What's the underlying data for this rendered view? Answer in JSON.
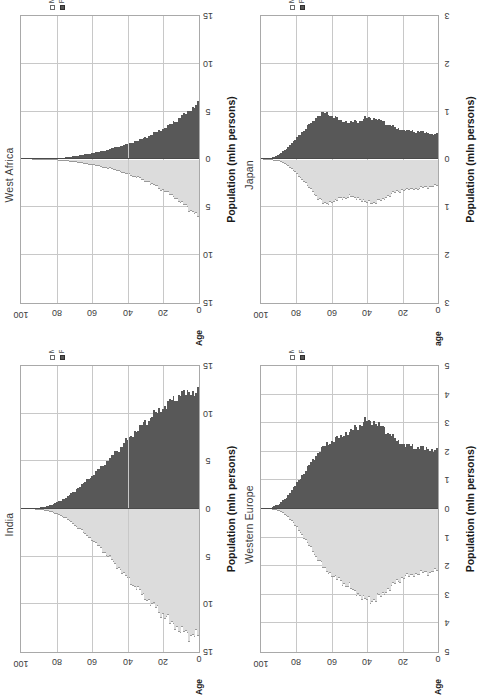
{
  "figure": {
    "kind": "population-pyramid-grid",
    "rotation_deg": -90,
    "panel_order": [
      "west_africa",
      "japan",
      "india",
      "western_europe"
    ]
  },
  "legend": {
    "male_label": "Male",
    "female_label": "Female",
    "male_swatch": "#ffffff",
    "female_swatch": "#585858"
  },
  "axes": {
    "population_title": "Population (mln persons)",
    "age_title_upper": "Age",
    "age_title_lower": "age",
    "age_ticks": [
      "100",
      "80",
      "60",
      "40",
      "20",
      "0"
    ]
  },
  "chart_data": [
    {
      "id": "west_africa",
      "type": "bar",
      "title": "West Africa",
      "subplot_position": "top-left",
      "xlabel": "Population (mln persons)",
      "ylabel": "Age",
      "ylabel_text": "Age",
      "legend": [
        "Male",
        "Female"
      ],
      "grid": true,
      "orientation": "horizontal-pyramid",
      "xlim": [
        -15,
        15
      ],
      "xticks": [
        -15,
        -10,
        -5,
        0,
        5,
        10,
        15
      ],
      "xtick_labels": [
        "15",
        "10",
        "5",
        "0",
        "5",
        "10",
        "15"
      ],
      "ylim": [
        0,
        100
      ],
      "yticks": [
        100,
        80,
        60,
        40,
        20,
        0
      ],
      "ytick_labels": [
        "100",
        "80",
        "60",
        "40",
        "20",
        "0"
      ],
      "ages": [
        0,
        5,
        10,
        15,
        20,
        25,
        30,
        35,
        40,
        45,
        50,
        55,
        60,
        65,
        70,
        75,
        80,
        85,
        90,
        95,
        100
      ],
      "series": [
        {
          "name": "Female",
          "side": "right",
          "color": "#585858",
          "values_by_age": [
            5.85,
            5.1,
            4.4,
            3.75,
            3.2,
            2.72,
            2.3,
            1.95,
            1.62,
            1.34,
            1.08,
            0.86,
            0.66,
            0.49,
            0.34,
            0.22,
            0.13,
            0.07,
            0.03,
            0.01,
            0.0
          ]
        },
        {
          "name": "Male",
          "side": "left",
          "color": "#dcdcdc",
          "values_by_age": [
            5.95,
            5.18,
            4.46,
            3.78,
            3.2,
            2.7,
            2.26,
            1.88,
            1.54,
            1.25,
            0.99,
            0.77,
            0.58,
            0.42,
            0.28,
            0.17,
            0.09,
            0.04,
            0.02,
            0.0,
            0.0
          ]
        }
      ]
    },
    {
      "id": "japan",
      "type": "bar",
      "title": "Japan",
      "subplot_position": "top-right",
      "xlabel": "Population (mln persons)",
      "ylabel": "age",
      "ylabel_text": "age",
      "legend": [
        "Male",
        "Female"
      ],
      "grid": true,
      "orientation": "horizontal-pyramid",
      "xlim": [
        -3,
        3
      ],
      "xticks": [
        -3,
        -2,
        -1,
        0,
        1,
        2,
        3
      ],
      "xtick_labels": [
        "3",
        "2",
        "1",
        "0",
        "1",
        "2",
        "3"
      ],
      "ylim": [
        0,
        100
      ],
      "yticks": [
        100,
        80,
        60,
        40,
        20,
        0
      ],
      "ytick_labels": [
        "100",
        "80",
        "60",
        "40",
        "20",
        "0"
      ],
      "ages": [
        0,
        5,
        10,
        15,
        20,
        25,
        30,
        35,
        40,
        45,
        50,
        55,
        60,
        65,
        70,
        75,
        80,
        85,
        90,
        95,
        100
      ],
      "series": [
        {
          "name": "Female",
          "side": "right",
          "color": "#585858",
          "values_by_age": [
            0.52,
            0.55,
            0.58,
            0.6,
            0.62,
            0.68,
            0.78,
            0.86,
            0.88,
            0.8,
            0.77,
            0.82,
            0.92,
            0.99,
            0.84,
            0.66,
            0.46,
            0.26,
            0.11,
            0.03,
            0.0
          ]
        },
        {
          "name": "Male",
          "side": "left",
          "color": "#dcdcdc",
          "values_by_age": [
            0.55,
            0.58,
            0.61,
            0.63,
            0.65,
            0.71,
            0.82,
            0.9,
            0.91,
            0.82,
            0.78,
            0.82,
            0.9,
            0.93,
            0.72,
            0.51,
            0.3,
            0.14,
            0.04,
            0.01,
            0.0
          ]
        }
      ]
    },
    {
      "id": "india",
      "type": "bar",
      "title": "India",
      "subplot_position": "bottom-left",
      "xlabel": "Population (mln persons)",
      "ylabel": "Age",
      "ylabel_text": "Age",
      "legend": [
        "Male",
        "Female"
      ],
      "grid": true,
      "orientation": "horizontal-pyramid",
      "xlim": [
        -15,
        15
      ],
      "xticks": [
        -15,
        -10,
        -5,
        0,
        5,
        10,
        15
      ],
      "xtick_labels": [
        "15",
        "10",
        "5",
        "0",
        "5",
        "10",
        "15"
      ],
      "ylim": [
        0,
        100
      ],
      "yticks": [
        100,
        80,
        60,
        40,
        20,
        0
      ],
      "ytick_labels": [
        "100",
        "80",
        "60",
        "40",
        "20",
        "0"
      ],
      "ages": [
        0,
        5,
        10,
        15,
        20,
        25,
        30,
        35,
        40,
        45,
        50,
        55,
        60,
        65,
        70,
        75,
        80,
        85,
        90,
        95,
        100
      ],
      "series": [
        {
          "name": "Female",
          "side": "right",
          "color": "#585858",
          "values_by_age": [
            12.2,
            12.3,
            12.0,
            11.4,
            10.6,
            9.9,
            9.1,
            8.2,
            7.3,
            6.3,
            5.3,
            4.4,
            3.5,
            2.7,
            1.9,
            1.2,
            0.7,
            0.32,
            0.12,
            0.03,
            0.0
          ]
        },
        {
          "name": "Male",
          "side": "left",
          "color": "#dcdcdc",
          "values_by_age": [
            13.3,
            13.2,
            12.8,
            12.0,
            11.1,
            10.2,
            9.3,
            8.3,
            7.3,
            6.2,
            5.2,
            4.2,
            3.3,
            2.5,
            1.7,
            1.0,
            0.55,
            0.24,
            0.08,
            0.02,
            0.0
          ]
        }
      ]
    },
    {
      "id": "western_europe",
      "type": "bar",
      "title": "Western Europe",
      "subplot_position": "bottom-right",
      "xlabel": "Population (mln persons)",
      "ylabel": "Age",
      "ylabel_text": "Age",
      "legend": [
        "Male",
        "Female"
      ],
      "grid": true,
      "orientation": "horizontal-pyramid",
      "xlim": [
        -5,
        5
      ],
      "xticks": [
        -5,
        -4,
        -3,
        -2,
        -1,
        0,
        1,
        2,
        3,
        4,
        5
      ],
      "xtick_labels": [
        "5",
        "4",
        "3",
        "2",
        "1",
        "0",
        "1",
        "2",
        "3",
        "4",
        "5"
      ],
      "ylim": [
        0,
        100
      ],
      "yticks": [
        100,
        80,
        60,
        40,
        20,
        0
      ],
      "ytick_labels": [
        "100",
        "80",
        "60",
        "40",
        "20",
        "0"
      ],
      "ages": [
        0,
        5,
        10,
        15,
        20,
        25,
        30,
        35,
        40,
        45,
        50,
        55,
        60,
        65,
        70,
        75,
        80,
        85,
        90,
        95,
        100
      ],
      "series": [
        {
          "name": "Female",
          "side": "right",
          "color": "#585858",
          "values_by_age": [
            2.05,
            2.1,
            2.15,
            2.2,
            2.28,
            2.52,
            2.8,
            3.02,
            3.1,
            2.9,
            2.7,
            2.55,
            2.38,
            2.18,
            1.8,
            1.36,
            0.92,
            0.48,
            0.18,
            0.04,
            0.0
          ]
        },
        {
          "name": "Male",
          "side": "left",
          "color": "#dcdcdc",
          "values_by_age": [
            2.18,
            2.22,
            2.26,
            2.32,
            2.42,
            2.66,
            2.94,
            3.16,
            3.22,
            2.98,
            2.74,
            2.55,
            2.32,
            2.04,
            1.58,
            1.1,
            0.66,
            0.28,
            0.08,
            0.01,
            0.0
          ]
        }
      ]
    }
  ]
}
